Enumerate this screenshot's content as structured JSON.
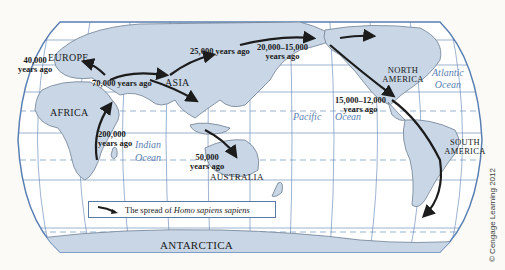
{
  "map": {
    "title": "The spread of Homo sapiens sapiens",
    "projection": "Robinson-style world map",
    "continents": [
      "EUROPE",
      "ASIA",
      "AFRICA",
      "AUSTRALIA",
      "NORTH AMERICA",
      "SOUTH AMERICA",
      "ANTARCTICA"
    ],
    "oceans": {
      "atlantic": [
        "Atlantic",
        "Ocean"
      ],
      "indian": [
        "Indian",
        "Ocean"
      ],
      "pacific": [
        "Pacific",
        "Ocean"
      ]
    },
    "migration_labels": {
      "europe": [
        "40,000",
        "years ago"
      ],
      "middle_east": "70,000 years ago",
      "africa": [
        "200,000",
        "years ago"
      ],
      "asia": "25,000 years ago",
      "beringia": [
        "20,000–15,000",
        "years ago"
      ],
      "americas": [
        "15,000–12,000",
        "years ago"
      ],
      "australia": [
        "50,000",
        "years ago"
      ]
    },
    "colors": {
      "land": "#c8d6e6",
      "land_edge": "#6f7f92",
      "ocean": "#ffffff",
      "graticule": "#5a7fb3",
      "arrow": "#1c1c1c",
      "ocean_label": "#5a7fb3"
    }
  },
  "legend": {
    "prefix": "The spread of ",
    "species": "Homo sapiens sapiens",
    "icon": "arrow-icon"
  },
  "credit": "© Cengage Learning 2012"
}
